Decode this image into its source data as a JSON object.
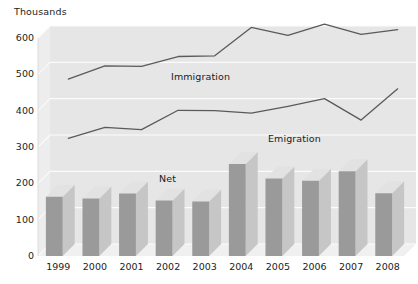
{
  "chart_data": {
    "type": "bar",
    "title": "",
    "subtitle": "",
    "unit_label": "Thousands",
    "xlabel": "",
    "ylabel": "",
    "ylim": [
      0,
      600
    ],
    "ytick_step": 100,
    "grid": true,
    "legend_position": "inline-annotations",
    "categories": [
      "1999",
      "2000",
      "2001",
      "2002",
      "2003",
      "2004",
      "2005",
      "2006",
      "2007",
      "2008"
    ],
    "yticks": [
      "0",
      "100",
      "200",
      "300",
      "400",
      "500",
      "600"
    ],
    "series": [
      {
        "name": "Immigration",
        "render": "line",
        "color": "#5a5a5a",
        "values": [
          454,
          490,
          489,
          516,
          518,
          596,
          574,
          605,
          577,
          590
        ]
      },
      {
        "name": "Emigration",
        "render": "line",
        "color": "#5a5a5a",
        "values": [
          291,
          321,
          315,
          368,
          367,
          360,
          379,
          400,
          341,
          427
        ]
      },
      {
        "name": "Net",
        "render": "bar3d",
        "color": "#9a9a9a",
        "values": [
          163,
          158,
          172,
          153,
          150,
          253,
          213,
          207,
          233,
          173
        ]
      }
    ],
    "annotations": [
      {
        "text": "Immigration",
        "x_px": 171,
        "y_px": 71
      },
      {
        "text": "Emigration",
        "x_px": 268,
        "y_px": 133
      },
      {
        "text": "Net",
        "x_px": 159,
        "y_px": 173
      }
    ],
    "colors": {
      "plot_background": "#e6e6e6",
      "wall_left": "#ededed",
      "floor": "#f0f0f0",
      "gridline": "#fbfbfb",
      "line": "#5a5a5a",
      "bar_front": "#9a9a9a",
      "bar_top": "#e2e2e2",
      "bar_side": "#c6c6c6",
      "text": "#1c1c1c"
    }
  }
}
